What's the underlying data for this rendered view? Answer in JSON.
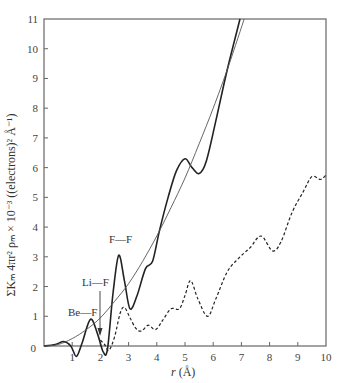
{
  "chart_data": {
    "type": "line",
    "title": "",
    "xlabel": "r (Å)",
    "ylabel": "ΣKₘ 4πr² ρₘ × 10⁻³ ((electrons)² Å⁻¹)",
    "xlim": [
      0,
      10
    ],
    "ylim": [
      0,
      11
    ],
    "x_ticks": [
      "0",
      "1",
      "2",
      "3",
      "4",
      "5",
      "6",
      "7",
      "8",
      "9",
      "10"
    ],
    "y_ticks": [
      "0",
      "1",
      "2",
      "3",
      "4",
      "5",
      "6",
      "7",
      "8",
      "9",
      "10",
      "11"
    ],
    "grid": false,
    "legend": null,
    "series": [
      {
        "name": "experimental RDF (solid, heavy)",
        "style": "solid-thick",
        "x": [
          0,
          0.4,
          0.7,
          0.95,
          1.15,
          1.35,
          1.65,
          1.9,
          2.1,
          2.25,
          2.45,
          2.65,
          2.85,
          3.05,
          3.3,
          3.6,
          3.85,
          4.1,
          4.4,
          4.7,
          5.0,
          5.25,
          5.5,
          5.75,
          6.1,
          6.5,
          6.95
        ],
        "values": [
          0,
          0.05,
          0.15,
          0.0,
          -0.35,
          0.1,
          0.9,
          0.4,
          -0.2,
          -0.1,
          1.8,
          3.05,
          2.2,
          1.25,
          1.7,
          2.6,
          2.85,
          3.9,
          5.0,
          5.9,
          6.3,
          6.0,
          5.8,
          6.2,
          7.6,
          9.3,
          11.0
        ]
      },
      {
        "name": "average density parabola (solid, thin)",
        "style": "solid-thin",
        "x": [
          0,
          0.5,
          1.0,
          1.5,
          2.0,
          2.5,
          3.0,
          3.5,
          4.0,
          4.5,
          5.0,
          5.5,
          6.0,
          6.5,
          7.1
        ],
        "values": [
          0,
          0.05,
          0.25,
          0.55,
          0.95,
          1.5,
          2.1,
          2.85,
          3.7,
          4.65,
          5.65,
          6.8,
          8.0,
          9.3,
          11.0
        ]
      },
      {
        "name": "difference curve (dashed)",
        "style": "dashed",
        "x": [
          2.0,
          2.15,
          2.3,
          2.5,
          2.7,
          2.85,
          3.05,
          3.25,
          3.45,
          3.7,
          3.95,
          4.2,
          4.5,
          4.8,
          5.0,
          5.2,
          5.45,
          5.8,
          6.1,
          6.5,
          6.9,
          7.3,
          7.7,
          8.1,
          8.4,
          8.8,
          9.2,
          9.5,
          9.8,
          10.0
        ],
        "values": [
          0.2,
          0.05,
          -0.15,
          0.3,
          1.1,
          1.3,
          0.95,
          0.6,
          0.5,
          0.7,
          0.55,
          0.85,
          1.25,
          1.25,
          1.7,
          2.2,
          1.6,
          1.0,
          1.6,
          2.5,
          2.95,
          3.3,
          3.7,
          3.2,
          3.5,
          4.5,
          5.2,
          5.7,
          5.6,
          5.75
        ]
      }
    ],
    "annotations": [
      {
        "text": "Be—F",
        "x": 1.65,
        "y": 1.1,
        "arrow_to": null
      },
      {
        "text": "Li—F",
        "x": 1.95,
        "y": 2.1,
        "arrow_to": [
          1.95,
          0.3
        ]
      },
      {
        "text": "F—F",
        "x": 2.55,
        "y": 3.4,
        "arrow_to": null
      }
    ]
  },
  "labels": {
    "x_axis_title_r": "r",
    "x_axis_title_unit": "(Å)",
    "annotation_bef": "Be—F",
    "annotation_lif": "Li—F",
    "annotation_ff": "F—F"
  },
  "colors": {
    "axis": "#555555",
    "curve": "#222222",
    "thin_curve": "#555555"
  }
}
